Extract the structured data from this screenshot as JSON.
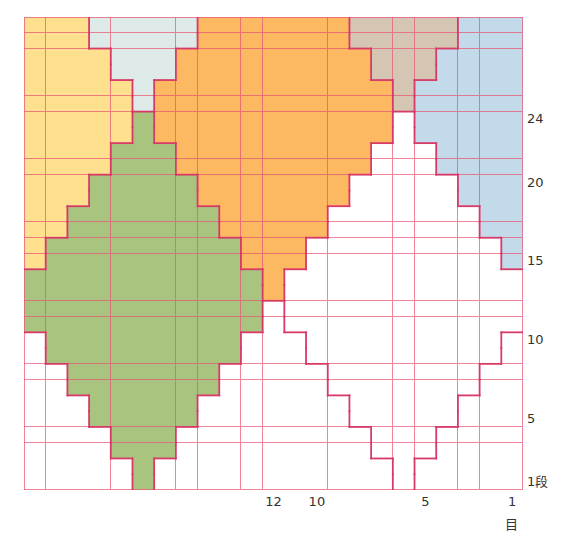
{
  "figure": {
    "type": "knitting-colorwork-chart",
    "columns": 23,
    "rows": 30,
    "palette": {
      "Y": "#FFE08E",
      "G": "#DDEAE8",
      "O": "#FDB862",
      "N": "#A9C47F",
      "T": "#D4C6B3",
      "B": "#C3DAEA",
      "W": "#FFFFFF",
      "E": "#FFFFFF"
    },
    "palette_names": {
      "Y": "yellow",
      "G": "pale-gray-blue",
      "O": "orange",
      "N": "green",
      "T": "taupe",
      "B": "light-blue",
      "W": "white-diamond",
      "E": "white-background"
    },
    "grid_line_color": "#E85A78",
    "outline_color": "#D83A68",
    "cells_top_to_bottom": [
      "YYYGGGGGOOOOOOOTTTTTBBB",
      "YYYGGGGGOOOOOOOTTTTTBBB",
      "YYYYGGGOOOOOOOOOTTTBBBB",
      "YYYYGGGOOOOOOOOOTTTBBBB",
      "YYYYYGOOOOOOOOOOOTBBBBB",
      "YYYYYGOOOOOOOOOOOTBBBBB",
      "YYYYYNOOOOOOOOOOOWBBBBB",
      "YYYYYNOOOOOOOOOOOWBBBBB",
      "YYYYNNNOOOOOOOOOWWWBBBB",
      "YYYYNNNOOOOOOOOOWWWBBBB",
      "YYYNNNNNOOOOOOOWWWWWBBB",
      "YYYNNNNNOOOOOOOWWWWWBBB",
      "YYNNNNNNNOOOOOWWWWWWWBB",
      "YYNNNNNNNOOOOOWWWWWWWBB",
      "YNNNNNNNNNOOOWWWWWWWWWB",
      "YNNNNNNNNNOOOWWWWWWWWWB",
      "NNNNNNNNNNNOWWWWWWWWWWW",
      "NNNNNNNNNNNOWWWWWWWWWWW",
      "NNNNNNNNNNNEWWWWWWWWWWW",
      "NNNNNNNNNNNEWWWWWWWWWWW",
      "ENNNNNNNNNEEEWWWWWWWWWE",
      "ENNNNNNNNNEEEWWWWWWWWWE",
      "EENNNNNNNEEEEEWWWWWWWEE",
      "EENNNNNNNEEEEEWWWWWWWEE",
      "EEENNNNNEEEEEEEWWWWWEEE",
      "EEENNNNNEEEEEEEWWWWWEEE",
      "EEEENNNEEEEEEEEEWWWEEEE",
      "EEEENNNEEEEEEEEEWWWEEEE",
      "EEEEENEEEEEEEEEEEWEEEEE",
      "EEEEENEEEEEEEEEEEWEEEEE"
    ]
  },
  "row_labels": [
    {
      "text": "24",
      "row": 24
    },
    {
      "text": "20",
      "row": 20
    },
    {
      "text": "15",
      "row": 15
    },
    {
      "text": "10",
      "row": 10
    },
    {
      "text": "5",
      "row": 5
    },
    {
      "text": "1段",
      "row": 1
    }
  ],
  "col_labels": [
    {
      "text": "12",
      "col": 12
    },
    {
      "text": "10",
      "col": 10
    },
    {
      "text": "5",
      "col": 5
    },
    {
      "text": "1",
      "col": 1
    }
  ],
  "col_unit_label": "目"
}
